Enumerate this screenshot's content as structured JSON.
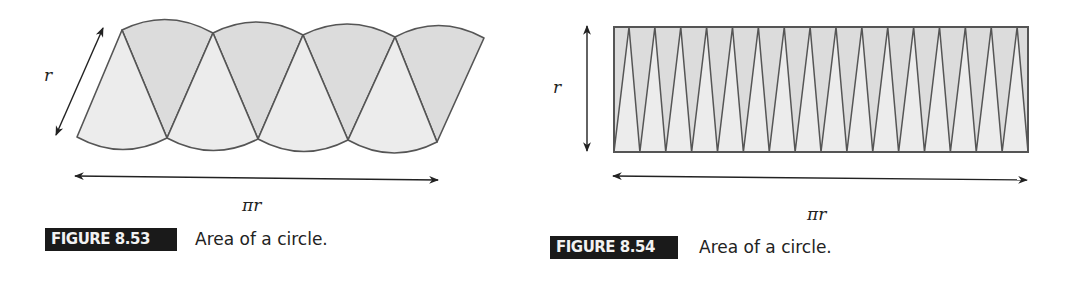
{
  "figures": [
    {
      "id": "8.53",
      "label": "FIGURE 8.53",
      "caption": "Area of a circle.",
      "side_label": "r",
      "bottom_label": "πr",
      "sector_count": 8,
      "shape": "parallelogram-like arrangement of circle sectors"
    },
    {
      "id": "8.54",
      "label": "FIGURE 8.54",
      "caption": "Area of a circle.",
      "side_label": "r",
      "bottom_label": "πr",
      "sector_count": 32,
      "shape": "near-rectangle arrangement of thin circle sectors"
    }
  ],
  "colors": {
    "sector_dark": "#dcdcdc",
    "sector_light": "#ececec",
    "stroke": "#555555",
    "arrow": "#222222",
    "label_bg": "#1a1a1a",
    "label_text": "#f2f2f2"
  }
}
